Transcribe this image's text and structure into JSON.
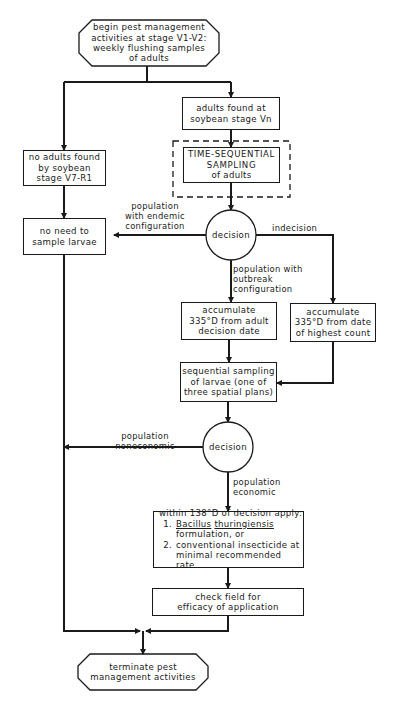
{
  "diagram": {
    "type": "flowchart",
    "start": {
      "lines": [
        "begin pest management",
        "activities at stage V1-V2:",
        "weekly flushing samples",
        "of adults"
      ]
    },
    "no_adults": {
      "lines": [
        "no  adults found",
        "by soybean",
        "stage V7-R1"
      ]
    },
    "adults_found": {
      "lines": [
        "adults found at",
        "soybean stage Vn"
      ]
    },
    "time_sequential": {
      "lines": [
        "TIME-SEQUENTIAL",
        "SAMPLING",
        "of adults"
      ]
    },
    "no_need": {
      "lines": [
        "no need to",
        "sample larvae"
      ]
    },
    "decision1": {
      "label": "decision"
    },
    "edge_endemic": {
      "lines": [
        "population",
        "with endemic",
        "configuration"
      ]
    },
    "edge_indecision": {
      "label": "indecision"
    },
    "edge_outbreak": {
      "lines": [
        "population with",
        "outbreak",
        "configuration"
      ]
    },
    "accumulate_adult": {
      "lines": [
        "accumulate",
        "335°D from adult",
        "decision date"
      ]
    },
    "accumulate_highest": {
      "lines": [
        "accumulate",
        "335°D from date",
        "of highest count"
      ]
    },
    "sequential_larvae": {
      "lines": [
        "sequential sampling",
        "of larvae (one of",
        "three spatial plans)"
      ]
    },
    "decision2": {
      "label": "decision"
    },
    "edge_noneconomic": {
      "lines": [
        "population",
        "noneconomic"
      ]
    },
    "edge_economic": {
      "lines": [
        "population",
        "economic"
      ]
    },
    "treatment": {
      "heading": "within 138°D of decision apply:",
      "items": [
        {
          "num": "1.",
          "genus": "Bacillus",
          "species": "thuringiensis",
          "rest": "formulation, or"
        },
        {
          "num": "2.",
          "line1": "conventional insecticide at",
          "line2": "minimal recommended rate"
        }
      ]
    },
    "check_field": {
      "lines": [
        "check field for",
        "efficacy of application"
      ]
    },
    "end": {
      "lines": [
        "terminate pest",
        "management activities"
      ]
    }
  }
}
